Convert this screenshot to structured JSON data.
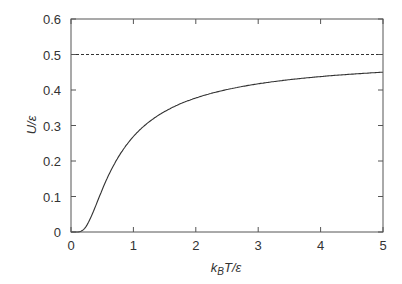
{
  "chart_data": {
    "type": "line",
    "title": "",
    "xlabel": "k_B T/ε",
    "xlabel_parts": {
      "k": "k",
      "sub": "B",
      "rest": "T/ε"
    },
    "ylabel": "U/ε",
    "xlim": [
      0,
      5
    ],
    "ylim": [
      0,
      0.6
    ],
    "xticks": [
      0,
      1,
      2,
      3,
      4,
      5
    ],
    "xtick_labels": [
      "0",
      "1",
      "2",
      "3",
      "4",
      "5"
    ],
    "yticks": [
      0,
      0.1,
      0.2,
      0.3,
      0.4,
      0.5,
      0.6
    ],
    "ytick_labels": [
      "0",
      "0.1",
      "0.2",
      "0.3",
      "0.4",
      "0.5",
      "0.6"
    ],
    "grid": false,
    "legend": null,
    "series": [
      {
        "name": "U/ε = 1/(e^(ε/k_BT)+1)",
        "style": "solid",
        "color": "#333333",
        "x": [
          0.1,
          0.2,
          0.3,
          0.4,
          0.5,
          0.6,
          0.8,
          1.0,
          1.25,
          1.5,
          2.0,
          2.5,
          3.0,
          3.5,
          4.0,
          4.5,
          5.0
        ],
        "y": [
          0.0,
          0.0067,
          0.0344,
          0.0759,
          0.1192,
          0.1589,
          0.2227,
          0.2689,
          0.31,
          0.3392,
          0.3775,
          0.4013,
          0.4174,
          0.429,
          0.4378,
          0.4446,
          0.4502
        ]
      },
      {
        "name": "asymptote",
        "style": "dashed",
        "color": "#333333",
        "x": [
          0,
          5
        ],
        "y": [
          0.5,
          0.5
        ]
      }
    ]
  },
  "colors": {
    "axis": "#555555",
    "curve": "#333333",
    "text": "#333333"
  }
}
